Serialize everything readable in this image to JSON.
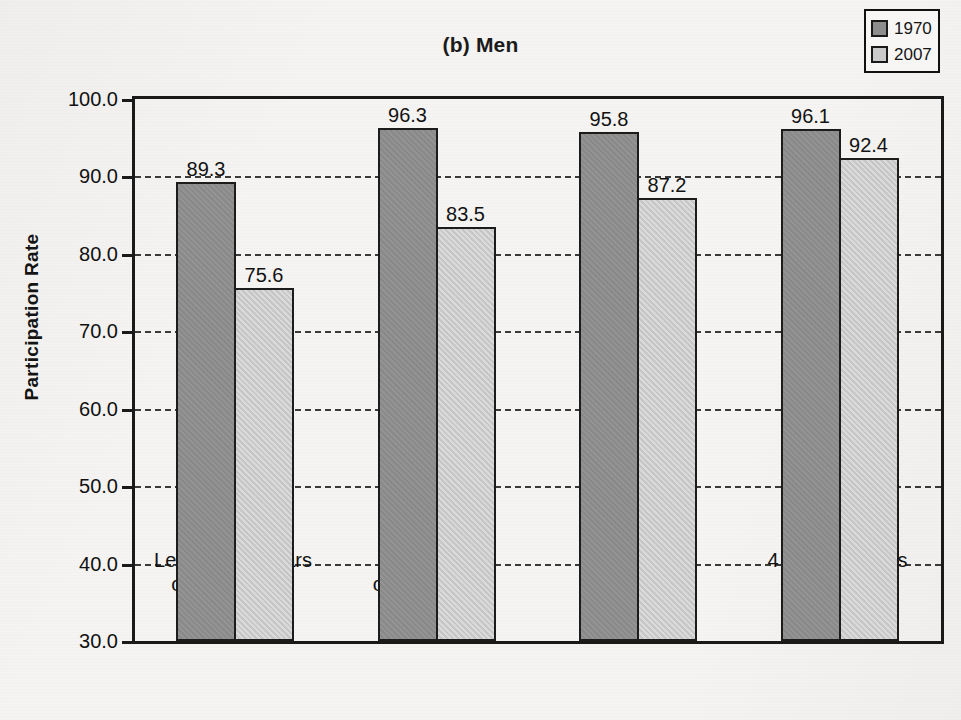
{
  "chart_data": {
    "type": "bar",
    "title": "(b) Men",
    "xlabel": "",
    "ylabel": "Participation Rate",
    "ylim": [
      30.0,
      100.0
    ],
    "ytick_step": 10.0,
    "ytick_labels": [
      "100.0",
      "90.0",
      "80.0",
      "70.0",
      "60.0",
      "50.0",
      "40.0",
      "30.0"
    ],
    "ytick_values": [
      100.0,
      90.0,
      80.0,
      70.0,
      60.0,
      50.0,
      40.0,
      30.0
    ],
    "grid": "horizontal-dashed",
    "legend_position": "top-right",
    "categories": [
      {
        "line1": "Less than 4 years",
        "line2": "of high school"
      },
      {
        "line1": "4 years",
        "line2": "of high school"
      },
      {
        "line1": "1–3 years",
        "line2": "of college"
      },
      {
        "line1": "4 or more years",
        "line2": "of college"
      }
    ],
    "series": [
      {
        "name": "1970",
        "color": "#8d8d8d",
        "values": [
          89.3,
          96.3,
          95.8,
          96.1
        ],
        "value_labels": [
          "89.3",
          "96.3",
          "95.8",
          "96.1"
        ]
      },
      {
        "name": "2007",
        "color": "#cacaca",
        "values": [
          75.6,
          83.5,
          87.2,
          92.4
        ],
        "value_labels": [
          "75.6",
          "83.5",
          "87.2",
          "92.4"
        ]
      }
    ]
  },
  "legend": {
    "items": [
      {
        "label": "1970",
        "color": "#8d8d8d"
      },
      {
        "label": "2007",
        "color": "#cacaca"
      }
    ]
  },
  "colors": {
    "axis": "#1a1a1a",
    "grid": "#3a3a3a",
    "text": "#121212",
    "background": "#f5f4f2",
    "series_1970": "#8d8d8d",
    "series_2007": "#cacaca"
  }
}
